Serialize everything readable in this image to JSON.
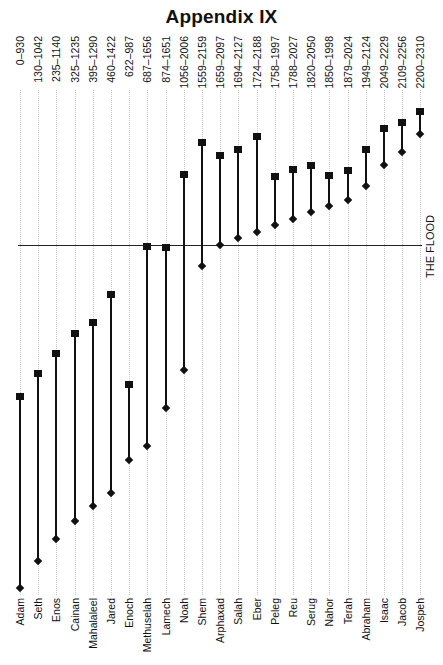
{
  "title": "Appendix IX",
  "flood_label": "THE FLOOD",
  "chart_data": {
    "type": "range",
    "title": "Appendix IX",
    "xlabel": "",
    "ylabel": "",
    "orientation": "vertical",
    "y_axis": "years (implicit, upward)",
    "ylim": [
      0,
      2310
    ],
    "grid": true,
    "annotations": [
      {
        "type": "hline",
        "value": 1656,
        "label": "THE FLOOD"
      }
    ],
    "markers": {
      "start": "diamond",
      "end": "square"
    },
    "categories": [
      "Adam",
      "Seth",
      "Enos",
      "Cainan",
      "Mahalaleel",
      "Jared",
      "Enoch",
      "Methuselah",
      "Lamech",
      "Noah",
      "Shem",
      "Arphaxad",
      "Salah",
      "Eber",
      "Peleg",
      "Reu",
      "Serug",
      "Nahor",
      "Terah",
      "Abraham",
      "Isaac",
      "Jacob",
      "Jospeh"
    ],
    "range_labels": [
      "0–930",
      "130–1042",
      "235–1140",
      "325–1235",
      "395–1290",
      "460–1422",
      "622–987",
      "687–1656",
      "874–1651",
      "1056–2006",
      "1559–2159",
      "1659–2097",
      "1694–2127",
      "1724–2188",
      "1758–1997",
      "1788–2027",
      "1820–2050",
      "1850–1998",
      "1879–2024",
      "1949–2124",
      "2049–2229",
      "2109–2256",
      "2200–2310"
    ],
    "series": [
      {
        "name": "start",
        "values": [
          0,
          130,
          235,
          325,
          395,
          460,
          622,
          687,
          874,
          1056,
          1559,
          1659,
          1694,
          1724,
          1758,
          1788,
          1820,
          1850,
          1879,
          1949,
          2049,
          2109,
          2200
        ]
      },
      {
        "name": "end",
        "values": [
          930,
          1042,
          1140,
          1235,
          1290,
          1422,
          987,
          1656,
          1651,
          2006,
          2159,
          2097,
          2127,
          2188,
          1997,
          2027,
          2050,
          1998,
          2024,
          2124,
          2229,
          2256,
          2310
        ]
      }
    ]
  }
}
